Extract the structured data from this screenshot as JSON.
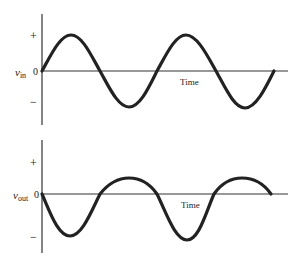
{
  "top_panel": {
    "signal_label_main": "v",
    "signal_label_sub": "in",
    "zero_label": "0",
    "plus_label": "+",
    "minus_label": "−",
    "axis_label": "Time"
  },
  "bottom_panel": {
    "signal_label_main": "v",
    "signal_label_sub": "out",
    "zero_label": "0",
    "plus_label": "+",
    "minus_label": "−",
    "axis_label": "Time"
  },
  "colors": {
    "axis": "#333333",
    "waveform": "#222222",
    "background": "#ffffff"
  }
}
